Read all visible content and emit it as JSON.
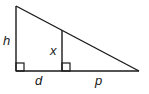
{
  "diagram": {
    "type": "similar-right-triangles",
    "labels": {
      "h": "h",
      "x": "x",
      "d": "d",
      "p": "p"
    },
    "stroke_color": "#1a1a1a",
    "background": "#ffffff"
  }
}
